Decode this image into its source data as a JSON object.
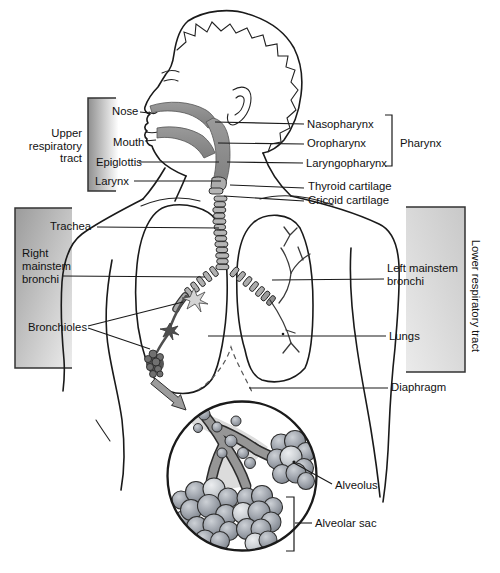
{
  "diagram": {
    "regions": {
      "upper_respiratory_tract": {
        "lines": [
          "Upper",
          "respiratory",
          "tract"
        ]
      },
      "lower_respiratory_tract": {
        "label": "Lower respiratory tract"
      }
    },
    "labels": {
      "nose": "Nose",
      "mouth": "Mouth",
      "epiglottis": "Epiglottis",
      "larynx": "Larynx",
      "nasopharynx": "Nasopharynx",
      "oropharynx": "Oropharynx",
      "laryngopharynx": "Laryngopharynx",
      "pharynx": "Pharynx",
      "thyroid_cartilage": "Thyroid cartilage",
      "cricoid_cartilage": "Cricoid cartilage",
      "trachea": "Trachea",
      "right_mainstem_bronchi": {
        "lines": [
          "Right",
          "mainstem",
          "bronchi"
        ]
      },
      "bronchioles": "Bronchioles",
      "left_mainstem_bronchi": {
        "lines": [
          "Left mainstem",
          "bronchi"
        ]
      },
      "lungs": "Lungs",
      "diaphragm": "Diaphragm",
      "alveolus": "Alveolus",
      "alveolar_sac": "Alveolar sac"
    },
    "colors": {
      "background": "#ffffff",
      "outline": "#1a1a1a",
      "label_text": "#111111",
      "box_gray_dark": "#989898",
      "box_gray_light": "#f2f2f2",
      "lung_fill": "#c9c9c9",
      "airway_dark": "#8a8a8a",
      "cartilage_ring": "#b5b5b5",
      "bronchiole_dark": "#4f4f4f",
      "duct_gray": "#969696",
      "alveoli_sphere": "#9aa0a8"
    }
  }
}
